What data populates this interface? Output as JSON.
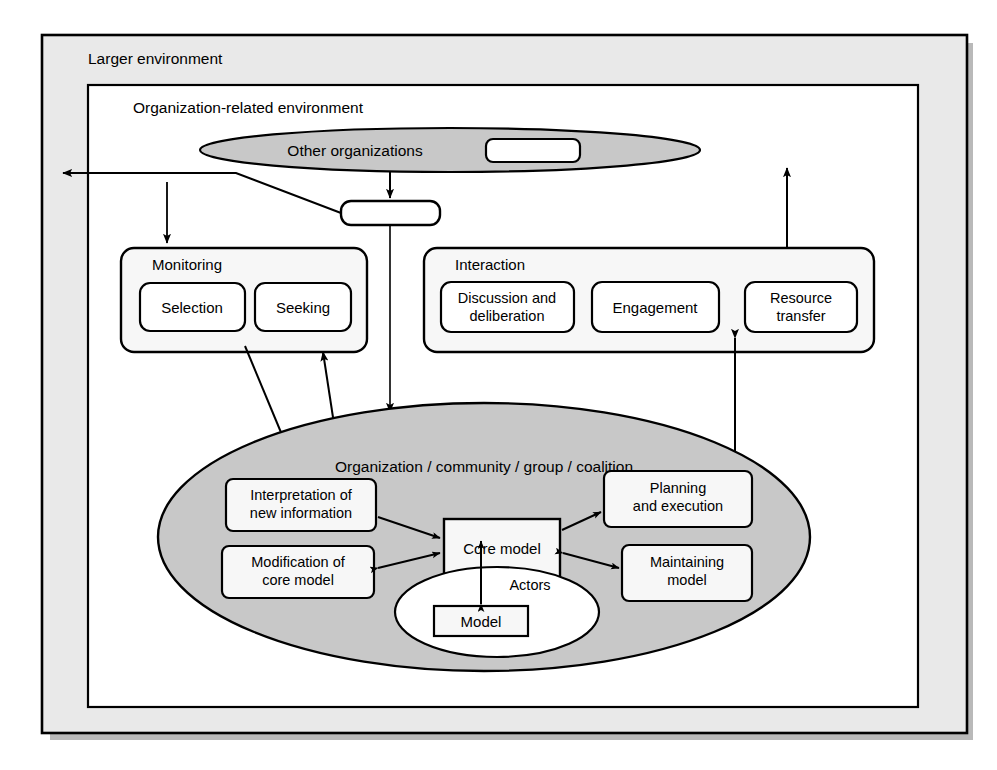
{
  "figure": {
    "type": "conceptual-block-diagram",
    "outer_frame": {
      "label": "Larger environment"
    },
    "inner_frame": {
      "label": "Organization-related environment"
    }
  },
  "nodes": {
    "other_organizations": {
      "label": "Other organizations",
      "shape": "ellipse",
      "fill": "#c8c8c8"
    },
    "other_org_inner_box": {
      "label": "",
      "shape": "rounded-rect",
      "fill": "#ffffff"
    },
    "connector_box": {
      "label": "",
      "shape": "rounded-rect",
      "fill": "#ffffff"
    },
    "monitoring": {
      "label": "Monitoring",
      "children": [
        {
          "label": "Selection"
        },
        {
          "label": "Seeking"
        }
      ]
    },
    "interaction": {
      "label": "Interaction",
      "children": [
        {
          "label": "Discussion and deliberation"
        },
        {
          "label": "Engagement"
        },
        {
          "label": "Resource transfer"
        }
      ]
    },
    "organization": {
      "label": "Organization / community / group / coalition",
      "shape": "ellipse",
      "fill": "#c8c8c8",
      "children": [
        {
          "label": "Interpretation of new information"
        },
        {
          "label": "Modification of core model"
        },
        {
          "label": "Core model"
        },
        {
          "label": "Planning and execution"
        },
        {
          "label": "Maintaining model"
        }
      ]
    },
    "actors": {
      "label": "Actors",
      "shape": "ellipse",
      "fill": "#ffffff",
      "children": [
        {
          "label": "Model"
        }
      ]
    }
  },
  "text": {
    "larger_environment": "Larger environment",
    "org_related_environment": "Organization-related environment",
    "other_organizations": "Other organizations",
    "monitoring": "Monitoring",
    "selection": "Selection",
    "seeking": "Seeking",
    "interaction": "Interaction",
    "discussion_line1": "Discussion and",
    "discussion_line2": "deliberation",
    "engagement": "Engagement",
    "resource_line1": "Resource",
    "resource_line2": "transfer",
    "organization_title": "Organization / community / group / coalition",
    "interpretation_line1": "Interpretation of",
    "interpretation_line2": "new information",
    "modification_line1": "Modification of",
    "modification_line2": "core model",
    "core_model": "Core model",
    "planning_line1": "Planning",
    "planning_line2": "and execution",
    "maintaining_line1": "Maintaining",
    "maintaining_line2": "model",
    "actors": "Actors",
    "model": "Model"
  },
  "colors": {
    "page_background": "#ffffff",
    "outer_frame_fill": "#e8e8e8",
    "inner_frame_fill": "#ffffff",
    "ellipse_fill": "#c8c8c8",
    "box_fill": "#f7f7f7",
    "stroke": "#000000",
    "shadow": "#b4b4b4"
  }
}
